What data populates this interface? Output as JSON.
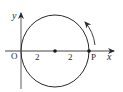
{
  "diagram": {
    "type": "coordinate-circle",
    "axes": {
      "x_label": "x",
      "y_label": "y",
      "origin_label": "O"
    },
    "circle": {
      "center_label": "",
      "radius_segments": [
        "2",
        "2"
      ],
      "point_label": "P",
      "rotation_direction": "counterclockwise"
    },
    "colors": {
      "stroke": "#2a2a2a",
      "axis": "#555555",
      "background": "#ffffff"
    }
  }
}
